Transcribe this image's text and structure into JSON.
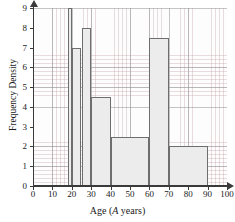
{
  "chart_data": {
    "type": "bar",
    "title": "",
    "subtitle": "",
    "xlabel": "Age (A years)",
    "xlabel_parts": {
      "prefix": "Age (",
      "variable": "A",
      "suffix": " years)"
    },
    "ylabel": "Frequency Density",
    "xlim": [
      0,
      100
    ],
    "ylim": [
      0,
      9
    ],
    "x_major_step": 10,
    "x_minor_step": 2,
    "y_major_step": 1,
    "y_minor_step": 0.2,
    "grid": true,
    "grid_minor": true,
    "legend": false,
    "legend_position": "none",
    "histogram": true,
    "bin_edges": [
      18,
      20,
      25,
      30,
      40,
      60,
      70,
      90
    ],
    "values": [
      9,
      7,
      8,
      4.5,
      2.5,
      7.5,
      2
    ],
    "bars": [
      {
        "label": "18-20",
        "x0": 18,
        "x1": 20,
        "value": 9
      },
      {
        "label": "20-25",
        "x0": 20,
        "x1": 25,
        "value": 7
      },
      {
        "label": "25-30",
        "x0": 25,
        "x1": 30,
        "value": 8
      },
      {
        "label": "30-40",
        "x0": 30,
        "x1": 40,
        "value": 4.5
      },
      {
        "label": "40-60",
        "x0": 40,
        "x1": 60,
        "value": 2.5
      },
      {
        "label": "60-70",
        "x0": 60,
        "x1": 70,
        "value": 7.5
      },
      {
        "label": "70-90",
        "x0": 70,
        "x1": 90,
        "value": 2
      }
    ],
    "x_ticks": [
      0,
      10,
      20,
      30,
      40,
      50,
      60,
      70,
      80,
      90,
      100
    ],
    "y_ticks": [
      0,
      1,
      2,
      3,
      4,
      5,
      6,
      7,
      8,
      9
    ],
    "colors": {
      "bar_fill": "#ececec",
      "bar_edge": "#6e6e6e",
      "axis": "#3a3a3a",
      "grid_major": "#96969b",
      "grid_minor": "#c8aaaf",
      "background": "#ffffff",
      "text": "#1a1a1a"
    }
  }
}
